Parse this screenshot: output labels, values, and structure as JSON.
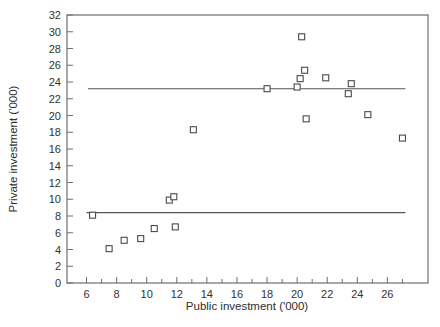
{
  "figure": {
    "background": "#ffffff"
  },
  "chart_data": {
    "type": "scatter",
    "title": "",
    "xlabel": "Public investment ('000)",
    "ylabel": "Private investment ('000)",
    "xlim": [
      4.7,
      28.7
    ],
    "ylim": [
      0,
      32
    ],
    "x_major_ticks": [
      6,
      8,
      10,
      12,
      14,
      16,
      18,
      20,
      22,
      24,
      26
    ],
    "x_minor_ticks": [
      7,
      9,
      11,
      13,
      15,
      17,
      19,
      21,
      23,
      25,
      27
    ],
    "y_ticks": [
      0,
      2,
      4,
      6,
      8,
      10,
      12,
      14,
      16,
      18,
      20,
      22,
      24,
      26,
      28,
      30,
      32
    ],
    "grid": false,
    "frame": true,
    "legend": null,
    "marker": "open-square",
    "points": [
      [
        6.4,
        8.1
      ],
      [
        7.5,
        4.1
      ],
      [
        8.5,
        5.1
      ],
      [
        9.6,
        5.3
      ],
      [
        10.5,
        6.5
      ],
      [
        11.9,
        6.7
      ],
      [
        11.5,
        9.9
      ],
      [
        11.8,
        10.3
      ],
      [
        13.1,
        18.3
      ],
      [
        18.0,
        23.2
      ],
      [
        20.0,
        23.4
      ],
      [
        20.2,
        24.4
      ],
      [
        20.5,
        25.4
      ],
      [
        20.3,
        29.4
      ],
      [
        21.9,
        24.5
      ],
      [
        20.6,
        19.6
      ],
      [
        23.4,
        22.6
      ],
      [
        23.6,
        23.8
      ],
      [
        24.7,
        20.1
      ],
      [
        27.0,
        17.3
      ]
    ],
    "reference_lines": [
      {
        "y": 8.4,
        "x_start": 6.0,
        "x_end": 27.2
      },
      {
        "y": 23.2,
        "x_start": 6.1,
        "x_end": 27.2
      }
    ],
    "colors": {
      "axis": "#6e6e6e",
      "marker_stroke": "#4a4a4a",
      "reference_line": "#555555",
      "text": "#333333"
    }
  }
}
